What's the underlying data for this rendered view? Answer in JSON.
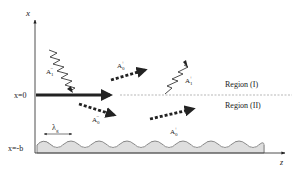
{
  "axes": {
    "x_label": "x",
    "z_label": "z"
  },
  "levels": {
    "x0": "x=0",
    "xb": "x=-b"
  },
  "regions": {
    "upper": "Region (I)",
    "lower": "Region (II)"
  },
  "waves": {
    "incident": {
      "base": "A",
      "sub": "1",
      "sup": "−"
    },
    "reflected_wavy": {
      "base": "A",
      "sub": "1",
      "sup": "+"
    },
    "dotted_up": {
      "base": "A",
      "sub": "0",
      "sup": "+"
    },
    "dotted_down_left": {
      "base": "A",
      "sub": "0",
      "sup": "−"
    },
    "dotted_down_right": {
      "base": "A",
      "sub": "0",
      "sup": "+"
    }
  },
  "grating": {
    "period_label_base": "λ",
    "period_label_sub": "g"
  },
  "colors": {
    "ink": "#222222",
    "dashed": "#888888"
  }
}
